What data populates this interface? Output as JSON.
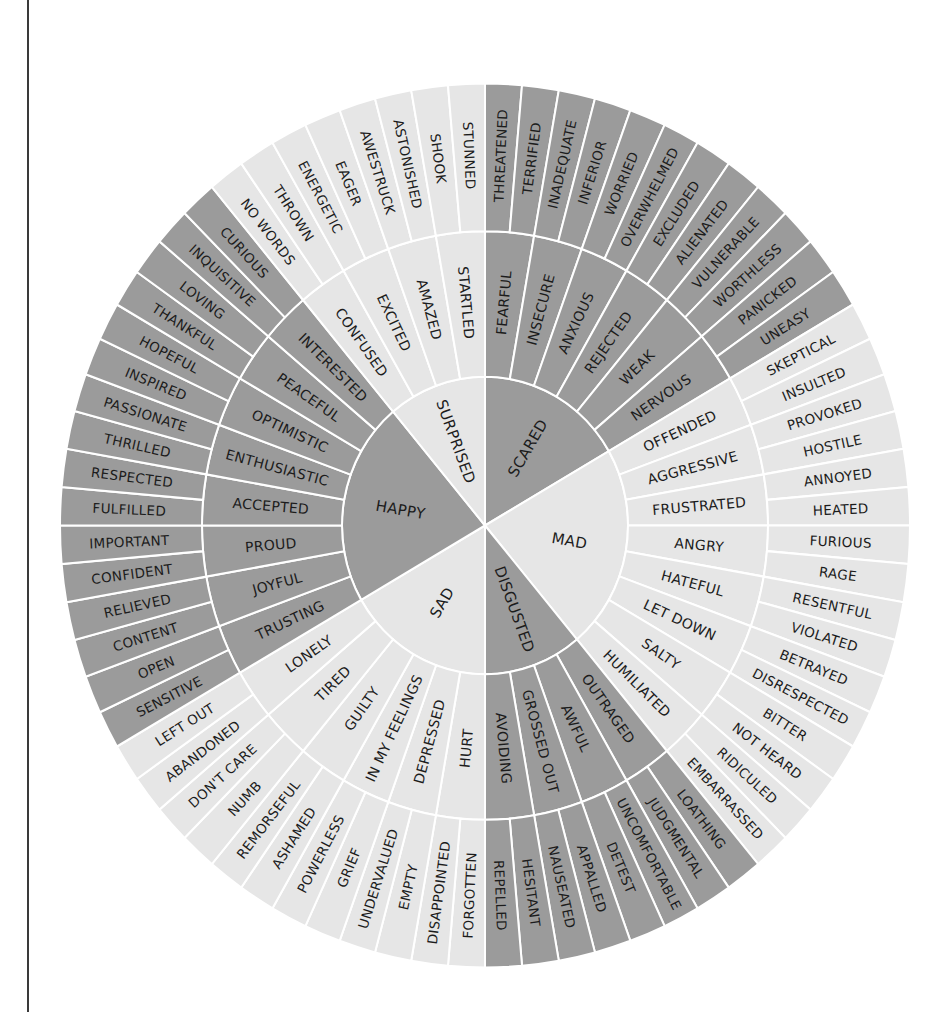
{
  "colors": {
    "dark": "#9b9b9b",
    "light": "#e6e6e6",
    "separator": "#ffffff",
    "text": "#1c1c1c",
    "rule": "#3a3a3a"
  },
  "geometry": {
    "cx": 485,
    "cy": 525.5,
    "r_core": 143,
    "r_mid": 283,
    "r_outer": 425,
    "y_scale": 1.04,
    "outer_step_deg": 5
  },
  "emotions": [
    {
      "name": "SCARED",
      "shade": "dark",
      "start": 0,
      "end": 60,
      "middle": [
        {
          "label": "FEARFUL",
          "outer": [
            "THREATENED",
            "TERRIFIED"
          ]
        },
        {
          "label": "INSECURE",
          "outer": [
            "INADEQUATE",
            "INFERIOR"
          ]
        },
        {
          "label": "ANXIOUS",
          "outer": [
            "WORRIED",
            "OVERWHELMED"
          ]
        },
        {
          "label": "REJECTED",
          "outer": [
            "EXCLUDED",
            "ALIENATED"
          ]
        },
        {
          "label": "WEAK",
          "outer": [
            "VULNERABLE",
            "WORTHLESS"
          ]
        },
        {
          "label": "NERVOUS",
          "outer": [
            "PANICKED",
            "UNEASY"
          ]
        }
      ]
    },
    {
      "name": "MAD",
      "shade": "light",
      "start": 60,
      "end": 140,
      "middle": [
        {
          "label": "OFFENDED",
          "outer": [
            "SKEPTICAL",
            "INSULTED"
          ]
        },
        {
          "label": "AGGRESSIVE",
          "outer": [
            "PROVOKED",
            "HOSTILE"
          ]
        },
        {
          "label": "FRUSTRATED",
          "outer": [
            "ANNOYED",
            "HEATED"
          ]
        },
        {
          "label": "ANGRY",
          "outer": [
            "FURIOUS",
            "RAGE"
          ]
        },
        {
          "label": "HATEFUL",
          "outer": [
            "RESENTFUL",
            "VIOLATED"
          ]
        },
        {
          "label": "LET DOWN",
          "outer": [
            "BETRAYED",
            "DISRESPECTED"
          ]
        },
        {
          "label": "SALTY",
          "outer": [
            "BITTER",
            "NOT HEARD"
          ]
        },
        {
          "label": "HUMILIATED",
          "outer": [
            "RIDICULED",
            "EMBARRASSED"
          ]
        }
      ]
    },
    {
      "name": "DISGUSTED",
      "shade": "dark",
      "start": 140,
      "end": 180,
      "middle": [
        {
          "label": "OUTRAGED",
          "outer": [
            "LOATHING",
            "JUDGMENTAL"
          ]
        },
        {
          "label": "AWFUL",
          "outer": [
            "UNCOMFORTABLE",
            "DETEST"
          ]
        },
        {
          "label": "GROSSED OUT",
          "outer": [
            "APPALLED",
            "NAUSEATED"
          ]
        },
        {
          "label": "AVOIDING",
          "outer": [
            "HESITANT",
            "REPELLED"
          ]
        }
      ]
    },
    {
      "name": "SAD",
      "shade": "light",
      "start": 180,
      "end": 240,
      "middle": [
        {
          "label": "HURT",
          "outer": [
            "FORGOTTEN",
            "DISAPPOINTED"
          ]
        },
        {
          "label": "DEPRESSED",
          "outer": [
            "EMPTY",
            "UNDERVALUED"
          ]
        },
        {
          "label": "IN MY FEELINGS",
          "outer": [
            "GRIEF",
            "POWERLESS"
          ]
        },
        {
          "label": "GUILTY",
          "outer": [
            "ASHAMED",
            "REMORSEFUL"
          ]
        },
        {
          "label": "TIRED",
          "outer": [
            "NUMB",
            "DON'T CARE"
          ]
        },
        {
          "label": "LONELY",
          "outer": [
            "ABANDONED",
            "LEFT OUT"
          ]
        }
      ]
    },
    {
      "name": "HAPPY",
      "shade": "dark",
      "start": 240,
      "end": 320,
      "middle": [
        {
          "label": "TRUSTING",
          "outer": [
            "SENSITIVE",
            "OPEN"
          ]
        },
        {
          "label": "JOYFUL",
          "outer": [
            "CONTENT",
            "RELIEVED"
          ]
        },
        {
          "label": "PROUD",
          "outer": [
            "CONFIDENT",
            "IMPORTANT"
          ]
        },
        {
          "label": "ACCEPTED",
          "outer": [
            "FULFILLED",
            "RESPECTED"
          ]
        },
        {
          "label": "ENTHUSIASTIC",
          "outer": [
            "THRILLED",
            "PASSIONATE"
          ]
        },
        {
          "label": "OPTIMISTIC",
          "outer": [
            "INSPIRED",
            "HOPEFUL"
          ]
        },
        {
          "label": "PEACEFUL",
          "outer": [
            "THANKFUL",
            "LOVING"
          ]
        },
        {
          "label": "INTERESTED",
          "outer": [
            "INQUISITIVE",
            "CURIOUS"
          ]
        }
      ]
    },
    {
      "name": "SURPRISED",
      "shade": "light",
      "start": 320,
      "end": 360,
      "middle": [
        {
          "label": "CONFUSED",
          "outer": [
            "NO WORDS",
            "THROWN"
          ]
        },
        {
          "label": "EXCITED",
          "outer": [
            "ENERGETIC",
            "EAGER"
          ]
        },
        {
          "label": "AMAZED",
          "outer": [
            "AWESTRUCK",
            "ASTONISHED"
          ]
        },
        {
          "label": "STARTLED",
          "outer": [
            "SHOOK",
            "STUNNED"
          ]
        }
      ]
    }
  ]
}
